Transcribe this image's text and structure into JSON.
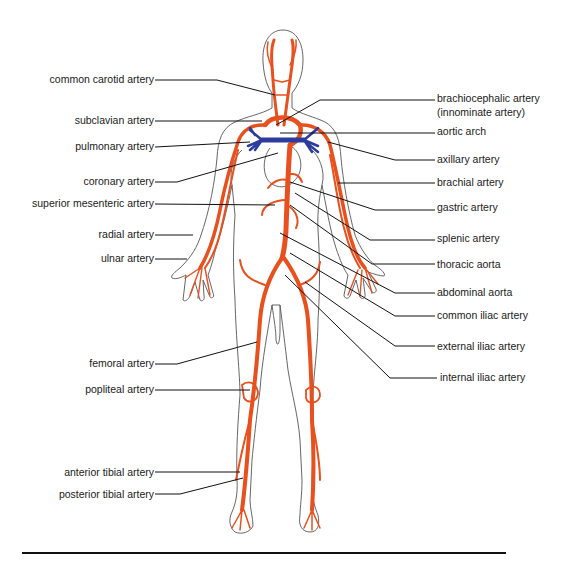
{
  "diagram": {
    "colors": {
      "artery": "#E8501E",
      "pulmonary_vessel": "#2B3C9E",
      "outline": "#4a4a4a",
      "leader": "#111111"
    },
    "labels_left": [
      {
        "id": "common-carotid-artery",
        "text": "common carotid artery",
        "x": 154,
        "y": 80
      },
      {
        "id": "subclavian-artery",
        "text": "subclavian artery",
        "x": 154,
        "y": 121
      },
      {
        "id": "pulmonary-artery",
        "text": "pulmonary artery",
        "x": 154,
        "y": 146
      },
      {
        "id": "coronary-artery",
        "text": "coronary artery",
        "x": 154,
        "y": 182
      },
      {
        "id": "superior-mesenteric-artery",
        "text": "superior mesenteric artery",
        "x": 154,
        "y": 204
      },
      {
        "id": "radial-artery",
        "text": "radial artery",
        "x": 154,
        "y": 235
      },
      {
        "id": "ulnar-artery",
        "text": "ulnar artery",
        "x": 154,
        "y": 259
      },
      {
        "id": "femoral-artery",
        "text": "femoral artery",
        "x": 154,
        "y": 364
      },
      {
        "id": "popliteal-artery",
        "text": "popliteal artery",
        "x": 154,
        "y": 390
      },
      {
        "id": "anterior-tibial-artery",
        "text": "anterior tibial artery",
        "x": 154,
        "y": 473
      },
      {
        "id": "posterior-tibial-artery",
        "text": "posterior tibial artery",
        "x": 154,
        "y": 495
      }
    ],
    "labels_right": [
      {
        "id": "brachiocephalic-artery",
        "text": "brachiocephalic artery",
        "x": 437,
        "y": 98
      },
      {
        "id": "innominate-artery",
        "text": "(innominate artery)",
        "x": 437,
        "y": 113
      },
      {
        "id": "aortic-arch",
        "text": "aortic arch",
        "x": 437,
        "y": 131
      },
      {
        "id": "axillary-artery",
        "text": "axillary artery",
        "x": 437,
        "y": 159
      },
      {
        "id": "brachial-artery",
        "text": "brachial artery",
        "x": 437,
        "y": 182
      },
      {
        "id": "gastric-artery",
        "text": "gastric artery",
        "x": 437,
        "y": 207
      },
      {
        "id": "splenic-artery",
        "text": "splenic artery",
        "x": 437,
        "y": 238
      },
      {
        "id": "thoracic-aorta",
        "text": "thoracic aorta",
        "x": 437,
        "y": 264
      },
      {
        "id": "abdominal-aorta",
        "text": "abdominal aorta",
        "x": 437,
        "y": 292
      },
      {
        "id": "common-iliac-artery",
        "text": "common iliac artery",
        "x": 437,
        "y": 315
      },
      {
        "id": "external-iliac-artery",
        "text": "external iliac artery",
        "x": 437,
        "y": 346
      },
      {
        "id": "internal-iliac-artery",
        "text": "internal iliac artery",
        "x": 440,
        "y": 377
      }
    ]
  }
}
